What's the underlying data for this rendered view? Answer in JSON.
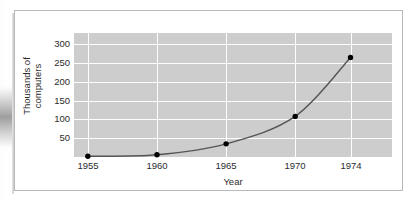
{
  "figure": {
    "frame_color": "#b9b9b9",
    "plot_background": "#cdcdcd",
    "gridline_color": "#fdfdfd",
    "series_color": "#555555",
    "marker_color": "#000000"
  },
  "chart_data": {
    "type": "line",
    "title": "",
    "subtitle": "",
    "xlabel": "Year",
    "ylabel_lines": [
      "Thousands of",
      "computers"
    ],
    "ylabel": "Thousands of computers",
    "x": [
      1955,
      1960,
      1965,
      1970,
      1974
    ],
    "values": [
      2,
      6,
      35,
      108,
      265
    ],
    "series": [
      {
        "name": "Computers in use",
        "values": [
          2,
          6,
          35,
          108,
          265
        ]
      }
    ],
    "xticks": [
      "1955",
      "1960",
      "1965",
      "1970",
      "1974"
    ],
    "xtick_values": [
      1955,
      1960,
      1965,
      1970,
      1974
    ],
    "yticks": [
      "300",
      "250",
      "200",
      "150",
      "100",
      "50"
    ],
    "ytick_values": [
      300,
      250,
      200,
      150,
      100,
      50
    ],
    "xlim": [
      1954,
      1977
    ],
    "ylim": [
      0,
      330
    ],
    "grid": true,
    "grid_axes": "both",
    "legend": false,
    "legend_position": "none",
    "markers": true,
    "marker_shape": "circle",
    "annotations": []
  }
}
